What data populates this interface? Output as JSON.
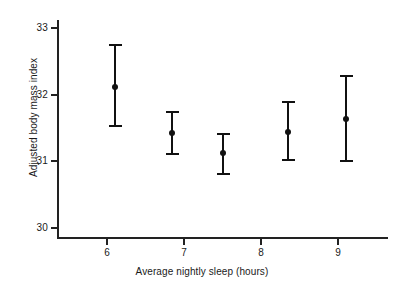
{
  "chart_data": {
    "type": "scatter",
    "title": "",
    "xlabel": "Average nightly sleep (hours)",
    "ylabel": "Adjusted body mass index",
    "xlim": [
      5.35,
      9.65
    ],
    "ylim": [
      29.85,
      33.15
    ],
    "xticks": [
      6,
      7,
      8,
      9
    ],
    "xtick_labels": [
      "6",
      "7",
      "8",
      "9"
    ],
    "yticks": [
      30,
      31,
      32,
      33
    ],
    "ytick_labels": [
      "30",
      "31",
      "32",
      "33"
    ],
    "grid": false,
    "legend": "none",
    "error_bars": "vertical with caps",
    "marker": "filled circle",
    "series": [
      {
        "name": "Adjusted body mass index",
        "color": "#111111",
        "points": [
          {
            "x": 6.1,
            "y": 32.12,
            "y_low": 31.51,
            "y_high": 32.76
          },
          {
            "x": 6.85,
            "y": 31.43,
            "y_low": 31.09,
            "y_high": 31.76
          },
          {
            "x": 7.5,
            "y": 31.12,
            "y_low": 30.79,
            "y_high": 31.43
          },
          {
            "x": 8.35,
            "y": 31.44,
            "y_low": 31.0,
            "y_high": 31.9
          },
          {
            "x": 9.1,
            "y": 31.63,
            "y_low": 30.99,
            "y_high": 32.29
          }
        ]
      }
    ]
  },
  "colors": {
    "axis": "#222222",
    "data": "#111111",
    "background": "#ffffff",
    "text": "#1a1a1a"
  }
}
